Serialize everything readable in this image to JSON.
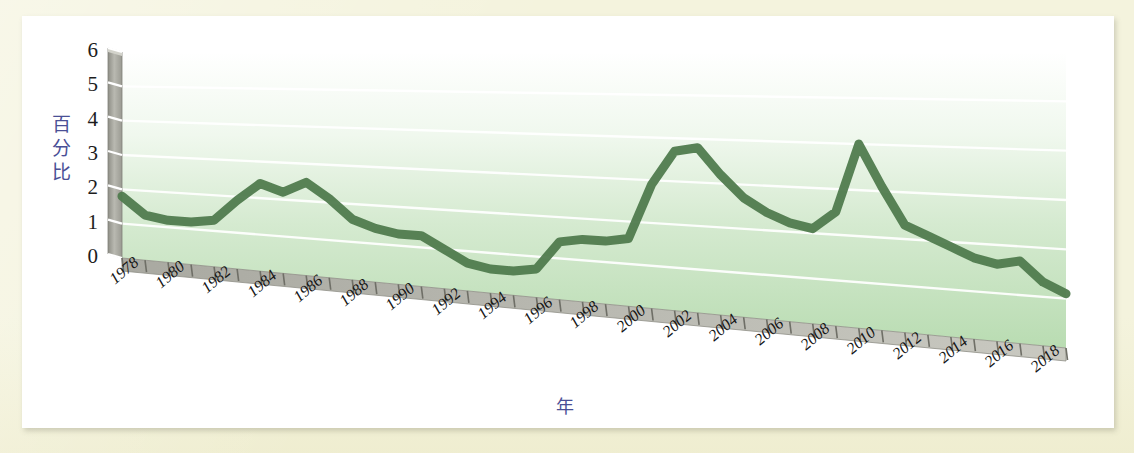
{
  "figure": {
    "mat_color": "#f4f3dd",
    "card_color": "#ffffff",
    "series_color": "#4f7a4c",
    "axis_title_color": "#4a4f96",
    "wall_color": "#9b9b93",
    "floor_color": "#b7d7b0"
  },
  "chart_data": {
    "type": "line",
    "title": "",
    "subtitle": "",
    "xlabel": "年",
    "ylabel": "百分比",
    "ylim": [
      0,
      6
    ],
    "ytick_values": [
      0,
      1,
      2,
      3,
      4,
      5,
      6
    ],
    "ytick_labels": [
      "0",
      "1",
      "2",
      "3",
      "4",
      "5",
      "6"
    ],
    "grid": true,
    "grid_color": "#ffffff",
    "legend": false,
    "legend_position": "none",
    "style": "3d-perspective-line",
    "x": [
      1978,
      1979,
      1980,
      1981,
      1982,
      1983,
      1984,
      1985,
      1986,
      1987,
      1988,
      1989,
      1990,
      1991,
      1992,
      1993,
      1994,
      1995,
      1996,
      1997,
      1998,
      1999,
      2000,
      2001,
      2002,
      2003,
      2004,
      2005,
      2006,
      2007,
      2008,
      2009,
      2010,
      2011,
      2012,
      2013,
      2014,
      2015,
      2016,
      2017,
      2018,
      2019
    ],
    "xtick_labels": [
      "1978",
      "1980",
      "1982",
      "1984",
      "1986",
      "1988",
      "1990",
      "1992",
      "1994",
      "1996",
      "1998",
      "2000",
      "2002",
      "2004",
      "2006",
      "2008",
      "2010",
      "2012",
      "2014",
      "2016",
      "2018"
    ],
    "xtick_label_step": 2,
    "series": [
      {
        "name": "百分比",
        "color": "#4f7a4c",
        "values": [
          1.8,
          1.3,
          1.2,
          1.2,
          1.3,
          1.9,
          2.4,
          2.2,
          2.5,
          2.1,
          1.6,
          1.4,
          1.3,
          1.3,
          1.0,
          0.7,
          0.6,
          0.6,
          0.7,
          1.4,
          1.5,
          1.5,
          1.6,
          2.9,
          3.7,
          3.8,
          3.2,
          2.7,
          2.4,
          2.2,
          2.1,
          2.5,
          4.0,
          3.1,
          2.3,
          2.1,
          1.9,
          1.7,
          1.6,
          1.7,
          1.3,
          1.1
        ]
      }
    ],
    "annotations": []
  }
}
